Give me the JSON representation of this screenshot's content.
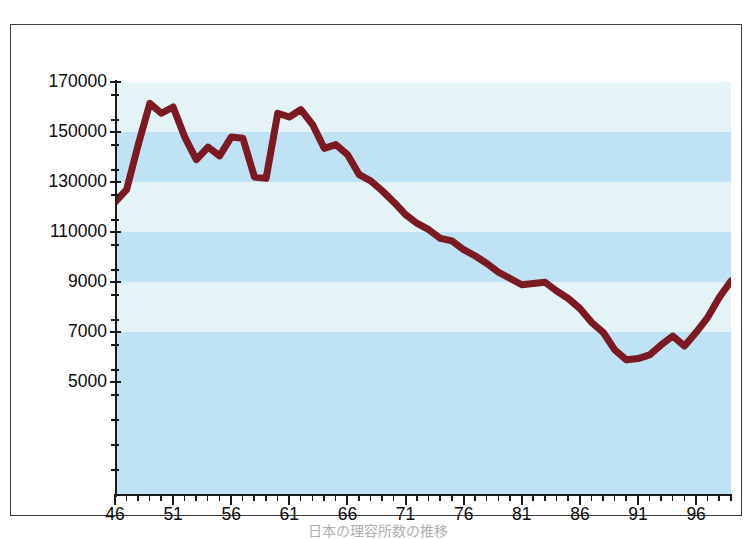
{
  "figure": {
    "caption": "日本の理容所数の推移",
    "line_color": "#7b1a22",
    "band_color_dark": "#bfe3f4",
    "band_color_light": "#e4f3f6",
    "axis_color": "#1a1a1a"
  },
  "chart_data": {
    "type": "line",
    "title": "",
    "subtitle": "",
    "xlabel": "",
    "ylabel": "",
    "grid": true,
    "legend": "none",
    "xlim": [
      46,
      99
    ],
    "ylim": [
      5000,
      170000
    ],
    "y_tick_labels": [
      "170000",
      "150000",
      "130000",
      "110000",
      "9000",
      "7000",
      "5000"
    ],
    "y_tick_values": [
      170000,
      150000,
      130000,
      110000,
      90000,
      70000,
      50000
    ],
    "y_minor_step": 10000,
    "x_tick_labels": [
      "46",
      "51",
      "56",
      "61",
      "66",
      "71",
      "76",
      "81",
      "86",
      "91",
      "96"
    ],
    "x_tick_values": [
      46,
      51,
      56,
      61,
      66,
      71,
      76,
      81,
      86,
      91,
      96
    ],
    "x_minor_step": 1,
    "series": [
      {
        "name": "facilities",
        "color": "#7b1a22",
        "x": [
          46,
          47,
          48,
          49,
          50,
          51,
          52,
          53,
          54,
          55,
          56,
          57,
          58,
          59,
          60,
          61,
          62,
          63,
          64,
          65,
          66,
          67,
          68,
          69,
          70,
          71,
          72,
          73,
          74,
          75,
          76,
          77,
          78,
          79,
          80,
          81,
          82,
          83,
          84,
          85,
          86,
          87,
          88,
          89,
          90,
          91,
          92,
          93,
          94,
          95,
          96,
          97,
          98,
          99
        ],
        "values": [
          122000,
          127000,
          145000,
          161500,
          157500,
          160000,
          148000,
          139000,
          144000,
          140500,
          148000,
          147500,
          132000,
          131500,
          157500,
          156000,
          159000,
          153000,
          143500,
          145000,
          141000,
          133000,
          130500,
          126500,
          122000,
          117000,
          113500,
          111000,
          107500,
          106500,
          103000,
          100500,
          97500,
          94000,
          91500,
          89000,
          89500,
          90000,
          86500,
          83500,
          79500,
          74000,
          70000,
          63000,
          59000,
          59500,
          61000,
          65000,
          68500,
          64500,
          70000,
          76000,
          84000,
          90500
        ]
      }
    ]
  }
}
